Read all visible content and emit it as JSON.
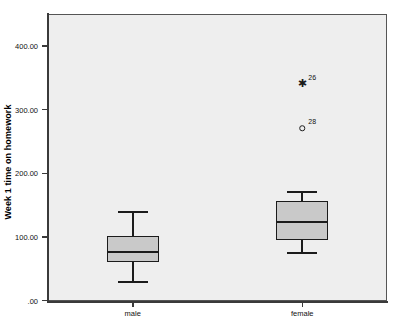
{
  "chart_data": {
    "type": "box",
    "title": "",
    "xlabel": "",
    "ylabel": "Week 1 time on homework",
    "ylim": [
      0,
      440
    ],
    "grid": false,
    "legend": "none",
    "y_ticks": [
      {
        "value": 0,
        "label": ".00"
      },
      {
        "value": 100,
        "label": "100.00"
      },
      {
        "value": 200,
        "label": "200.00"
      },
      {
        "value": 300,
        "label": "300.00"
      },
      {
        "value": 400,
        "label": "400.00"
      }
    ],
    "categories": [
      "male",
      "female"
    ],
    "boxes": [
      {
        "category": "male",
        "whisker_low": 30,
        "q1": 60,
        "median": 76,
        "q3": 101,
        "whisker_high": 140,
        "outliers": []
      },
      {
        "category": "female",
        "whisker_low": 76,
        "q1": 95,
        "median": 123,
        "q3": 157,
        "whisker_high": 172,
        "outliers": [
          {
            "value": 340,
            "label": "26",
            "marker": "star"
          },
          {
            "value": 271,
            "label": "28",
            "marker": "circle"
          }
        ]
      }
    ]
  },
  "style": {
    "plot_background": "#eeeeee",
    "box_fill": "#c9c9c9",
    "line_color": "#1b1b1b",
    "axis_color": "#3a3a3a"
  }
}
